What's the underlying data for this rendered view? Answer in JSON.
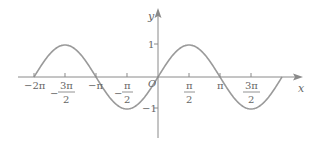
{
  "chart_data": {
    "type": "line",
    "title": "",
    "function": "y = sin(x)",
    "xlabel": "x",
    "ylabel": "y",
    "xlim": [
      -6.2832,
      6.2832
    ],
    "ylim": [
      -1,
      1
    ],
    "grid": false,
    "legend": null,
    "origin_label": "O",
    "x_ticks": [
      {
        "value": -6.2832,
        "label": "−2π",
        "frac": false
      },
      {
        "value": -4.7124,
        "label": "3π/2",
        "num": "3π",
        "den": "2",
        "neg": true,
        "frac": true
      },
      {
        "value": -3.1416,
        "label": "−π",
        "frac": false
      },
      {
        "value": -1.5708,
        "label": "π/2",
        "num": "π",
        "den": "2",
        "neg": true,
        "frac": true
      },
      {
        "value": 1.5708,
        "label": "π/2",
        "num": "π",
        "den": "2",
        "neg": false,
        "frac": true
      },
      {
        "value": 3.1416,
        "label": "π",
        "frac": false
      },
      {
        "value": 4.7124,
        "label": "3π/2",
        "num": "3π",
        "den": "2",
        "neg": false,
        "frac": true
      }
    ],
    "y_ticks": [
      {
        "value": 1,
        "label": "1"
      },
      {
        "value": -1,
        "label": "−1"
      }
    ],
    "series": [
      {
        "name": "sin(x)",
        "x": [
          -6.2832,
          -4.7124,
          -3.1416,
          -1.5708,
          0,
          1.5708,
          3.1416,
          4.7124,
          6.2832
        ],
        "values": [
          0,
          1,
          0,
          -1,
          0,
          1,
          0,
          -1,
          0
        ],
        "color": "#9a9a9a"
      }
    ]
  },
  "labels": {
    "x_axis": "x",
    "y_axis": "y",
    "origin": "O",
    "y_pos_one": "1",
    "y_neg_one": "−1",
    "neg_two_pi": "−2π",
    "neg_pi": "−π",
    "pi": "π",
    "three_pi": "3π",
    "pi_sym": "π",
    "two": "2",
    "neg_sign": "−"
  }
}
